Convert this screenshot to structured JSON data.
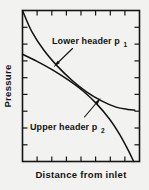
{
  "figure": {
    "background_color": "#f2f2f0",
    "line_color": "#111111"
  },
  "chart_data": {
    "type": "line",
    "title": "",
    "subtitle": "",
    "xlabel": "Distance from inlet",
    "ylabel": "Pressure",
    "xlim": [
      0,
      1
    ],
    "ylim": [
      0,
      1
    ],
    "grid": false,
    "legend_position": "inline-annotations",
    "axis_tick_labels": {
      "x": [],
      "y": []
    },
    "x_tick_count": 7,
    "y_tick_count": 8,
    "ticks_direction": "inward",
    "frame": "box",
    "series": [
      {
        "name": "Lower header p1",
        "label_text": "Lower header p",
        "label_subscript": "1",
        "x": [
          0.0,
          0.08,
          0.18,
          0.3,
          0.42,
          0.55,
          0.68,
          0.8,
          0.9,
          0.96
        ],
        "y": [
          1.0,
          0.86,
          0.74,
          0.63,
          0.54,
          0.46,
          0.4,
          0.36,
          0.345,
          0.34
        ]
      },
      {
        "name": "Upper header p2",
        "label_text": "Upper header p",
        "label_subscript": "2",
        "x": [
          0.0,
          0.12,
          0.26,
          0.4,
          0.52,
          0.63,
          0.74,
          0.83,
          0.9,
          0.95
        ],
        "y": [
          0.71,
          0.665,
          0.605,
          0.535,
          0.465,
          0.385,
          0.285,
          0.18,
          0.08,
          0.0
        ]
      }
    ],
    "annotations": [
      {
        "text": "Lower header p₁",
        "points_to_series": "Lower header p1",
        "leader": true
      },
      {
        "text": "Upper header p₂",
        "points_to_series": "Upper header p2",
        "leader": true
      }
    ]
  }
}
